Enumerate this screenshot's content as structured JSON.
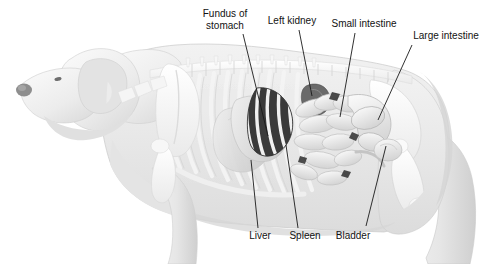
{
  "figure": {
    "view": "left lateral",
    "background_color": "#ffffff",
    "line_color": "#1a1a1a",
    "text_color": "#121212"
  },
  "labels": [
    {
      "id": "fundus-of-stomach",
      "name": "label-fundus-of-stomach",
      "lines": [
        "Fundus of",
        "stomach"
      ],
      "x": 192,
      "y": 8,
      "width": 66,
      "align": "center",
      "leader": {
        "x1": 243,
        "y1": 34,
        "x2": 268,
        "y2": 136
      }
    },
    {
      "id": "left-kidney",
      "name": "label-left-kidney",
      "lines": [
        "Left kidney"
      ],
      "x": 262,
      "y": 15,
      "width": 60,
      "align": "center",
      "leader": {
        "x1": 299,
        "y1": 30,
        "x2": 312,
        "y2": 96
      }
    },
    {
      "id": "small-intestine",
      "name": "label-small-intestine",
      "lines": [
        "Small intestine"
      ],
      "x": 326,
      "y": 18,
      "width": 76,
      "align": "center",
      "leader": {
        "x1": 355,
        "y1": 33,
        "x2": 340,
        "y2": 117
      }
    },
    {
      "id": "large-intestine",
      "name": "label-large-intestine",
      "lines": [
        "Large intestine"
      ],
      "x": 407,
      "y": 30,
      "width": 78,
      "align": "center",
      "leader": {
        "x1": 412,
        "y1": 45,
        "x2": 378,
        "y2": 120
      }
    },
    {
      "id": "liver",
      "name": "label-liver",
      "lines": [
        "Liver"
      ],
      "x": 245,
      "y": 230,
      "width": 30,
      "align": "center",
      "leader": {
        "x1": 258,
        "y1": 228,
        "x2": 251,
        "y2": 160
      }
    },
    {
      "id": "spleen",
      "name": "label-spleen",
      "lines": [
        "Spleen"
      ],
      "x": 285,
      "y": 230,
      "width": 40,
      "align": "center",
      "leader": {
        "x1": 298,
        "y1": 228,
        "x2": 286,
        "y2": 145
      }
    },
    {
      "id": "bladder",
      "name": "label-bladder",
      "lines": [
        "Bladder"
      ],
      "x": 331,
      "y": 230,
      "width": 44,
      "align": "center",
      "leader": {
        "x1": 366,
        "y1": 226,
        "x2": 386,
        "y2": 146
      }
    }
  ],
  "organs": [
    {
      "id": "stomach",
      "name": "organ-stomach",
      "tone": "#e2e2e2"
    },
    {
      "id": "spleen",
      "name": "organ-spleen",
      "tone": "#2a2a2a"
    },
    {
      "id": "left-kidney",
      "name": "organ-left-kidney",
      "tone": "#555555"
    },
    {
      "id": "small-intestine",
      "name": "organ-small-intestine",
      "tone": "#e9e9e9"
    },
    {
      "id": "large-intestine",
      "name": "organ-large-intestine",
      "tone": "#dedede"
    },
    {
      "id": "liver",
      "name": "organ-liver",
      "tone": "#dcdcdc"
    },
    {
      "id": "bladder",
      "name": "organ-bladder",
      "tone": "#e4e4e4"
    }
  ],
  "skeleton": [
    {
      "id": "skull",
      "name": "bone-skull"
    },
    {
      "id": "spine",
      "name": "bone-spine"
    },
    {
      "id": "ribcage",
      "name": "bone-ribcage"
    },
    {
      "id": "scapula",
      "name": "bone-scapula"
    },
    {
      "id": "pelvis",
      "name": "bone-pelvis"
    },
    {
      "id": "femur",
      "name": "bone-femur"
    },
    {
      "id": "humerus",
      "name": "bone-humerus"
    }
  ]
}
